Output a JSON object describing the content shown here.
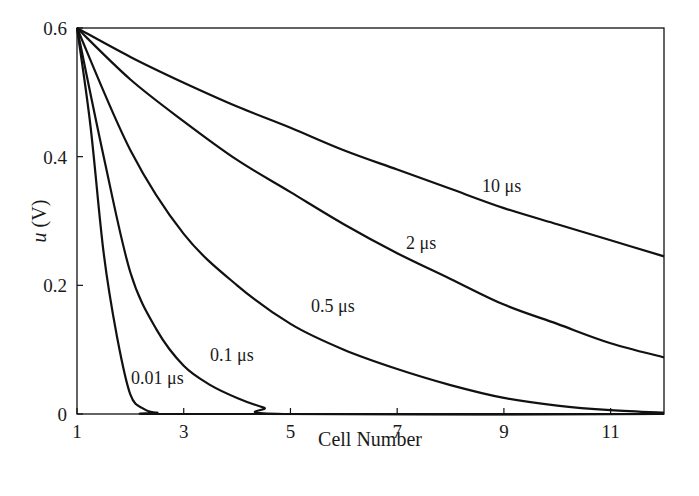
{
  "chart_data": {
    "type": "line",
    "title": "",
    "xlabel": "Cell Number",
    "ylabel": "u (V)",
    "ylabel_italic_part": "u",
    "ylabel_rest": " (V)",
    "xlim": [
      1,
      12
    ],
    "ylim": [
      0,
      0.6
    ],
    "grid": false,
    "legend": "inline labels",
    "x_ticks": [
      1,
      3,
      5,
      7,
      9,
      11
    ],
    "x_tick_labels": [
      "1",
      "3",
      "5",
      "7",
      "9",
      "11"
    ],
    "y_ticks": [
      0,
      0.2,
      0.4,
      0.6
    ],
    "y_tick_labels": [
      "0",
      "0.2",
      "0.4",
      "0.6"
    ],
    "series": [
      {
        "name": "10 μs",
        "label_pos": [
          482,
          192
        ],
        "x": [
          1,
          2,
          3,
          4,
          5,
          6,
          7,
          8,
          9,
          10,
          11,
          12
        ],
        "values": [
          0.6,
          0.555,
          0.515,
          0.478,
          0.445,
          0.41,
          0.38,
          0.35,
          0.32,
          0.295,
          0.27,
          0.245
        ]
      },
      {
        "name": "2 μs",
        "label_pos": [
          406,
          249
        ],
        "x": [
          1,
          2,
          3,
          4,
          5,
          6,
          7,
          8,
          9,
          10,
          11,
          12
        ],
        "values": [
          0.6,
          0.52,
          0.455,
          0.395,
          0.345,
          0.295,
          0.25,
          0.21,
          0.17,
          0.14,
          0.11,
          0.088
        ]
      },
      {
        "name": "0.5 μs",
        "label_pos": [
          311,
          312
        ],
        "x": [
          1,
          2,
          3,
          4,
          5,
          6,
          7,
          8,
          9,
          10,
          11,
          12
        ],
        "values": [
          0.6,
          0.41,
          0.28,
          0.2,
          0.14,
          0.1,
          0.07,
          0.045,
          0.025,
          0.013,
          0.006,
          0.002
        ]
      },
      {
        "name": "0.1 μs",
        "label_pos": [
          210,
          361
        ],
        "x": [
          1,
          1.5,
          2,
          2.5,
          3,
          3.5,
          4,
          4.5,
          5,
          12
        ],
        "values": [
          0.6,
          0.4,
          0.22,
          0.13,
          0.075,
          0.045,
          0.025,
          0.01,
          0,
          0
        ]
      },
      {
        "name": "0.01 μs",
        "label_pos": [
          131,
          384
        ],
        "x": [
          1,
          1.25,
          1.5,
          1.75,
          2,
          2.25,
          2.5,
          3,
          12
        ],
        "values": [
          0.6,
          0.45,
          0.25,
          0.12,
          0.03,
          0.008,
          0.002,
          0,
          0
        ]
      }
    ],
    "colors": {
      "line": "#111111",
      "text": "#1a1a1a",
      "background": "#ffffff"
    }
  }
}
